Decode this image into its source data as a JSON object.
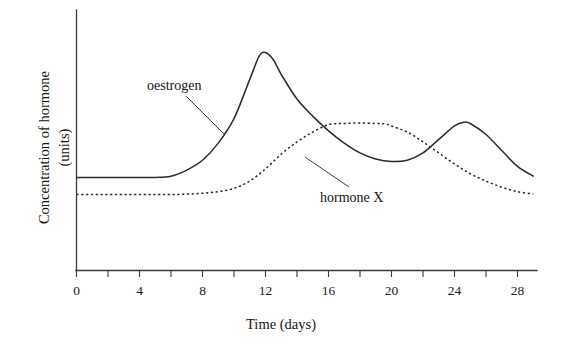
{
  "chart_data": {
    "type": "line",
    "title": "",
    "xlabel": "Time (days)",
    "ylabel_line1": "Concentration of hormone",
    "ylabel_line2": "(units)",
    "xlim": [
      0,
      29.2
    ],
    "ylim": [
      0,
      1
    ],
    "grid": false,
    "legend_position": "inline-annotations",
    "x_major_ticks": [
      0,
      4,
      8,
      12,
      16,
      20,
      24,
      28
    ],
    "x_major_tick_labels": [
      "0",
      "4",
      "8",
      "12",
      "16",
      "20",
      "24",
      "28"
    ],
    "x_minor_ticks": [
      2,
      6,
      10,
      14,
      18,
      22,
      26
    ],
    "y_ticks": [],
    "y_tick_labels": [],
    "annotations": [
      {
        "text": "oestrogen",
        "series": "oestrogen"
      },
      {
        "text": "hormone X",
        "series": "hormone X"
      }
    ],
    "series": [
      {
        "name": "oestrogen",
        "style": "solid",
        "x": [
          0,
          1,
          2,
          3,
          4,
          5,
          6,
          7,
          8,
          9,
          10,
          11,
          11.6,
          12,
          12.5,
          13,
          14,
          15,
          16,
          17,
          18,
          19,
          20,
          21,
          22,
          23,
          24,
          24.6,
          25,
          26,
          27,
          28,
          29
        ],
        "y": [
          0.38,
          0.38,
          0.38,
          0.38,
          0.38,
          0.38,
          0.385,
          0.41,
          0.45,
          0.52,
          0.62,
          0.78,
          0.875,
          0.89,
          0.86,
          0.8,
          0.7,
          0.63,
          0.57,
          0.52,
          0.48,
          0.455,
          0.445,
          0.45,
          0.48,
          0.535,
          0.59,
          0.605,
          0.6,
          0.555,
          0.49,
          0.425,
          0.385
        ]
      },
      {
        "name": "hormone X",
        "style": "dotted",
        "x": [
          0,
          1,
          2,
          3,
          4,
          5,
          6,
          7,
          8,
          9,
          10,
          11,
          12,
          13,
          14,
          15,
          16,
          17,
          18,
          19,
          19.6,
          20,
          21,
          22,
          23,
          24,
          25,
          26,
          27,
          28,
          29
        ],
        "y": [
          0.31,
          0.31,
          0.31,
          0.31,
          0.31,
          0.31,
          0.31,
          0.312,
          0.315,
          0.322,
          0.335,
          0.365,
          0.415,
          0.475,
          0.525,
          0.565,
          0.595,
          0.6,
          0.602,
          0.6,
          0.598,
          0.59,
          0.565,
          0.525,
          0.48,
          0.435,
          0.395,
          0.365,
          0.34,
          0.322,
          0.312
        ]
      }
    ]
  },
  "axes": {
    "x_tick_labels": [
      "0",
      "4",
      "8",
      "12",
      "16",
      "20",
      "24",
      "28"
    ],
    "x_title": "Time (days)",
    "y_title_line1": "Concentration of hormone",
    "y_title_line2": "(units)"
  },
  "labels": {
    "oestrogen": "oestrogen",
    "hormone_x": "hormone X"
  },
  "colors": {
    "ink": "#2b2b2b",
    "axis": "#3a3a3a",
    "background": "#ffffff"
  }
}
